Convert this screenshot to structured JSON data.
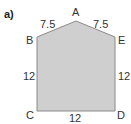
{
  "part_label": "a)",
  "shape": {
    "fill": "#cfcfcf",
    "stroke": "#8a8a8a",
    "vertices": {
      "A": [
        76,
        21
      ],
      "B": [
        37,
        37
      ],
      "C": [
        37,
        111
      ],
      "D": [
        115,
        111
      ],
      "E": [
        115,
        37
      ]
    }
  },
  "vertex_labels": {
    "A": "A",
    "B": "B",
    "C": "C",
    "D": "D",
    "E": "E"
  },
  "side_lengths": {
    "AB": "7.5",
    "AE": "7.5",
    "BC": "12",
    "ED": "12",
    "CD": "12"
  }
}
